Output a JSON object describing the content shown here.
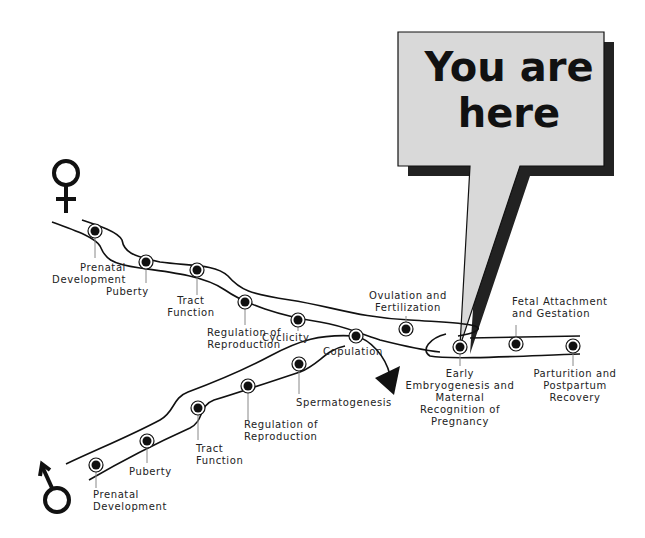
{
  "callout": {
    "text": "You are\nhere",
    "fill": "#d9d9d9"
  },
  "symbols": {
    "female": "female-symbol",
    "male": "male-symbol"
  },
  "female_path": [
    {
      "label": "Prenatal\nDevelopment"
    },
    {
      "label": "Puberty"
    },
    {
      "label": "Tract\nFunction"
    },
    {
      "label": "Regulation of\nReproduction"
    },
    {
      "label": "Cyclicity"
    },
    {
      "label": "Ovulation and\nFertilization"
    }
  ],
  "male_path": [
    {
      "label": "Prenatal\nDevelopment"
    },
    {
      "label": "Puberty"
    },
    {
      "label": "Tract\nFunction"
    },
    {
      "label": "Regulation of\nReproduction"
    },
    {
      "label": "Spermatogenesis"
    }
  ],
  "junction": {
    "label": "Copulation"
  },
  "pregnancy_path": [
    {
      "label": "Early\nEmbryogenesis and\nMaternal\nRecognition of\nPregnancy"
    },
    {
      "label": "Fetal Attachment\nand Gestation"
    },
    {
      "label": "Parturition and\nPostpartum\nRecovery"
    }
  ]
}
